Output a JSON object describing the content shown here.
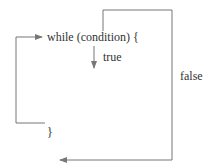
{
  "diagram": {
    "code": {
      "header": "while (condition) {",
      "closing_brace": "}"
    },
    "edges": [
      {
        "id": "true-branch",
        "label": "true",
        "from": "condition",
        "to": "body"
      },
      {
        "id": "false-branch",
        "label": "false",
        "from": "condition",
        "to": "after-loop"
      },
      {
        "id": "loop-back",
        "label": "",
        "from": "closing-brace",
        "to": "condition"
      }
    ],
    "colors": {
      "line": "#777777",
      "text": "#333333",
      "background": "#ffffff"
    }
  }
}
